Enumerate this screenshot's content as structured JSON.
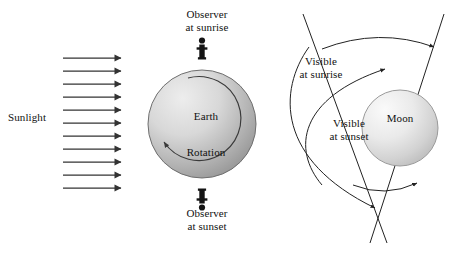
{
  "figure": {
    "background_color": "#ffffff",
    "ink_color": "#111111",
    "width": 456,
    "height": 253
  },
  "left_panel": {
    "name": "earth-panel",
    "sunlight_label": "Sunlight",
    "sunlight_rays": {
      "count": 11,
      "direction": "left-to-right",
      "color": "#333333"
    },
    "earth": {
      "label": "Earth",
      "rotation_label": "Rotation",
      "rotation_direction": "counterclockwise",
      "fill_light": "#e8e8e8",
      "fill_dark": "#9a9a9a",
      "stroke": "#6f6f6f",
      "center_x": 202,
      "center_y": 124,
      "radius": 54
    },
    "observer_top": {
      "label_line1": "Observer",
      "label_line2": "at sunrise",
      "icon": "person-icon",
      "orientation": "upright"
    },
    "observer_bottom": {
      "label_line1": "Observer",
      "label_line2": "at sunset",
      "icon": "person-icon",
      "orientation": "inverted"
    }
  },
  "right_panel": {
    "name": "moon-panel",
    "moon": {
      "label": "Moon",
      "fill_light": "#f2f2f2",
      "fill_dark": "#c2c2c2",
      "stroke": "#9a9a9a",
      "center_x": 400,
      "center_y": 128,
      "radius": 38
    },
    "sightline_sunrise": {
      "label_line1": "Visible",
      "label_line2": "at sunrise",
      "arc_arrow": "outer-arc"
    },
    "sightline_sunset": {
      "label_line1": "Visible",
      "label_line2": "at sunset",
      "arc_arrow": "inner-arc"
    },
    "crossing_lines": {
      "count": 2,
      "color": "#222222"
    },
    "span_arcs": {
      "count": 2,
      "positions": [
        "top",
        "bottom"
      ],
      "color": "#222222"
    }
  }
}
